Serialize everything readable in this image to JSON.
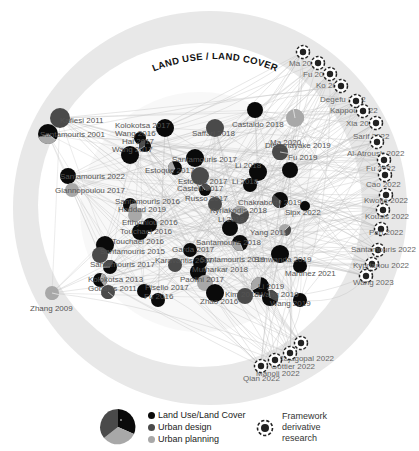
{
  "title": "LAND USE / LAND COVER",
  "colors": {
    "outer_ring": "#e6e6e6",
    "inner_disk": "#ffffff",
    "edge": "#bdbdbd",
    "land_use": "#0a0a0a",
    "urban_design": "#4a4a4a",
    "urban_planning": "#a8a8a8",
    "label": "#555555"
  },
  "nodes": [
    {
      "label": "Kafiesi 2011",
      "x": 60,
      "y": 118,
      "r": 10,
      "lx": 60,
      "ly": 123
    },
    {
      "label": "Santamouris 2001",
      "x": 48,
      "y": 134,
      "r": 10,
      "lx": 40,
      "ly": 137
    },
    {
      "label": "Kolokotsa 2017",
      "x": 165,
      "y": 128,
      "r": 9,
      "lx": 115,
      "ly": 128
    },
    {
      "label": "Wang 2016",
      "x": 140,
      "y": 138,
      "r": 6,
      "lx": 115,
      "ly": 136
    },
    {
      "label": "Hai 2017",
      "x": 145,
      "y": 146,
      "r": 6,
      "lx": 122,
      "ly": 144
    },
    {
      "label": "Saffari 2018",
      "x": 215,
      "y": 128,
      "r": 9,
      "lx": 192,
      "ly": 136
    },
    {
      "label": "Castaldo 2018",
      "x": 255,
      "y": 110,
      "r": 8,
      "lx": 232,
      "ly": 127
    },
    {
      "label": "Ma 2020",
      "x": 295,
      "y": 118,
      "r": 9,
      "lx": 270,
      "ly": 145
    },
    {
      "label": "Wang 2017",
      "x": 130,
      "y": 155,
      "r": 9,
      "lx": 112,
      "ly": 152
    },
    {
      "label": "Santamouris 2017",
      "x": 195,
      "y": 158,
      "r": 9,
      "lx": 172,
      "ly": 162
    },
    {
      "label": "Dissanayake 2019",
      "x": 280,
      "y": 152,
      "r": 8,
      "lx": 265,
      "ly": 148
    },
    {
      "label": "Fu 2019",
      "x": 290,
      "y": 170,
      "r": 8,
      "lx": 288,
      "ly": 160
    },
    {
      "label": "Santamouris 2022",
      "x": 68,
      "y": 176,
      "r": 8,
      "lx": 60,
      "ly": 179
    },
    {
      "label": "Estoque 2017",
      "x": 175,
      "y": 168,
      "r": 7,
      "lx": 145,
      "ly": 173
    },
    {
      "label": "Giannopoulou 2017",
      "x": 72,
      "y": 190,
      "r": 7,
      "lx": 55,
      "ly": 193
    },
    {
      "label": "Estoque 2017",
      "x": 200,
      "y": 176,
      "r": 9,
      "lx": 178,
      "ly": 184
    },
    {
      "label": "Castelli 2017",
      "x": 205,
      "y": 190,
      "r": 6,
      "lx": 177,
      "ly": 191
    },
    {
      "label": "Li 2018",
      "x": 258,
      "y": 172,
      "r": 9,
      "lx": 235,
      "ly": 168
    },
    {
      "label": "Li 2018",
      "x": 250,
      "y": 185,
      "r": 7,
      "lx": 232,
      "ly": 184
    },
    {
      "label": "Santamouris 2016",
      "x": 130,
      "y": 205,
      "r": 7,
      "lx": 115,
      "ly": 204
    },
    {
      "label": "Russo 2017",
      "x": 215,
      "y": 204,
      "r": 7,
      "lx": 185,
      "ly": 201
    },
    {
      "label": "Haddad 2019",
      "x": 135,
      "y": 215,
      "r": 7,
      "lx": 118,
      "ly": 212
    },
    {
      "label": "Chakraborty 2019",
      "x": 280,
      "y": 200,
      "r": 8,
      "lx": 238,
      "ly": 205
    },
    {
      "label": "Sipx 2022",
      "x": 305,
      "y": 206,
      "r": 5,
      "lx": 285,
      "ly": 215
    },
    {
      "label": "Efthymiou 2016",
      "x": 150,
      "y": 225,
      "r": 7,
      "lx": 122,
      "ly": 225
    },
    {
      "label": "Kyriakodis 2018",
      "x": 240,
      "y": 215,
      "r": 9,
      "lx": 210,
      "ly": 213
    },
    {
      "label": "Touchaei 2016",
      "x": 140,
      "y": 232,
      "r": 8,
      "lx": 120,
      "ly": 234
    },
    {
      "label": "Li 2018",
      "x": 230,
      "y": 228,
      "r": 8,
      "lx": 218,
      "ly": 222
    },
    {
      "label": "Yang 2019",
      "x": 285,
      "y": 230,
      "r": 6,
      "lx": 250,
      "ly": 235
    },
    {
      "label": "Touchaei 2016",
      "x": 105,
      "y": 245,
      "r": 9,
      "lx": 112,
      "ly": 244
    },
    {
      "label": "Santamouris 2015",
      "x": 100,
      "y": 255,
      "r": 8,
      "lx": 100,
      "ly": 254
    },
    {
      "label": "Santamouris 2018",
      "x": 240,
      "y": 243,
      "r": 8,
      "lx": 196,
      "ly": 245
    },
    {
      "label": "Garda 2017",
      "x": 190,
      "y": 250,
      "r": 7,
      "lx": 172,
      "ly": 252
    },
    {
      "label": "Simwanda 2019",
      "x": 280,
      "y": 254,
      "r": 9,
      "lx": 254,
      "ly": 262
    },
    {
      "label": "Santamouris 2017",
      "x": 110,
      "y": 267,
      "r": 7,
      "lx": 90,
      "ly": 267
    },
    {
      "label": "Karavantis 2017",
      "x": 175,
      "y": 265,
      "r": 7,
      "lx": 155,
      "ly": 263
    },
    {
      "label": "Santamouris 2019",
      "x": 200,
      "y": 262,
      "r": 7,
      "lx": 200,
      "ly": 262
    },
    {
      "label": "Kolokotsa 2013",
      "x": 100,
      "y": 280,
      "r": 7,
      "lx": 88,
      "ly": 282
    },
    {
      "label": "Mutharkar 2018",
      "x": 198,
      "y": 272,
      "r": 8,
      "lx": 192,
      "ly": 272
    },
    {
      "label": "Martinez 2021",
      "x": 300,
      "y": 266,
      "r": 7,
      "lx": 285,
      "ly": 276
    },
    {
      "label": "Gobakis 2011",
      "x": 108,
      "y": 292,
      "r": 7,
      "lx": 88,
      "ly": 291
    },
    {
      "label": "Pisello 2017",
      "x": 144,
      "y": 291,
      "r": 7,
      "lx": 145,
      "ly": 290
    },
    {
      "label": "Paolini 2017",
      "x": 205,
      "y": 283,
      "r": 8,
      "lx": 180,
      "ly": 282
    },
    {
      "label": "Li 2019",
      "x": 260,
      "y": 286,
      "r": 9,
      "lx": 258,
      "ly": 289
    },
    {
      "label": "Fu 2016",
      "x": 158,
      "y": 300,
      "r": 7,
      "lx": 144,
      "ly": 299
    },
    {
      "label": "Kim 2018",
      "x": 245,
      "y": 296,
      "r": 8,
      "lx": 225,
      "ly": 297
    },
    {
      "label": "Wang 2019",
      "x": 270,
      "y": 298,
      "r": 8,
      "lx": 258,
      "ly": 297
    },
    {
      "label": "Zhao 2016",
      "x": 215,
      "y": 293,
      "r": 9,
      "lx": 200,
      "ly": 304
    },
    {
      "label": "Wang 2019",
      "x": 300,
      "y": 300,
      "r": 7,
      "lx": 270,
      "ly": 306
    },
    {
      "label": "Zhang 2009",
      "x": 52,
      "y": 293,
      "r": 7,
      "lx": 30,
      "ly": 311
    }
  ],
  "framework_nodes": [
    {
      "label": "Ma 2022",
      "x": 303,
      "y": 52,
      "lx": 289,
      "ly": 66
    },
    {
      "label": "Fu 2022",
      "x": 318,
      "y": 63,
      "lx": 303,
      "ly": 77
    },
    {
      "label": "Ko 2022",
      "x": 330,
      "y": 74,
      "lx": 316,
      "ly": 88
    },
    {
      "label": "Degefu 2022",
      "x": 341,
      "y": 86,
      "lx": 320,
      "ly": 102
    },
    {
      "label": "Kappou 2022",
      "x": 356,
      "y": 101,
      "lx": 330,
      "ly": 113
    },
    {
      "label": "Xia 2022",
      "x": 363,
      "y": 111,
      "lx": 346,
      "ly": 126
    },
    {
      "label": "Sarif 2022",
      "x": 376,
      "y": 123,
      "lx": 353,
      "ly": 139
    },
    {
      "label": "Al-Atroush 2022",
      "x": 377,
      "y": 142,
      "lx": 347,
      "ly": 156
    },
    {
      "label": "Fu 2022",
      "x": 384,
      "y": 160,
      "lx": 366,
      "ly": 171
    },
    {
      "label": "Cao 2022",
      "x": 385,
      "y": 175,
      "lx": 366,
      "ly": 187
    },
    {
      "label": "Kwofie 2022",
      "x": 386,
      "y": 195,
      "lx": 364,
      "ly": 203
    },
    {
      "label": "Kousis 2022",
      "x": 383,
      "y": 210,
      "lx": 365,
      "ly": 219
    },
    {
      "label": "Pan 2022",
      "x": 381,
      "y": 229,
      "lx": 369,
      "ly": 235
    },
    {
      "label": "Santamouris 2022",
      "x": 378,
      "y": 250,
      "lx": 351,
      "ly": 252
    },
    {
      "label": "Kyprianou 2022",
      "x": 372,
      "y": 264,
      "lx": 353,
      "ly": 268
    },
    {
      "label": "Wang 2023",
      "x": 366,
      "y": 276,
      "lx": 353,
      "ly": 285
    },
    {
      "label": "Rajagopal 2022",
      "x": 301,
      "y": 343,
      "lx": 278,
      "ly": 361
    },
    {
      "label": "Gottier 2022",
      "x": 290,
      "y": 353,
      "lx": 271,
      "ly": 369
    },
    {
      "label": "Manoli 2022",
      "x": 275,
      "y": 360,
      "lx": 256,
      "ly": 376
    },
    {
      "label": "Qian 2022",
      "x": 261,
      "y": 366,
      "lx": 243,
      "ly": 381
    }
  ],
  "legend": {
    "categories": [
      {
        "label": "Land Use/Land Cover",
        "color": "#0a0a0a"
      },
      {
        "label": "Urban design",
        "color": "#4a4a4a"
      },
      {
        "label": "Urban planning",
        "color": "#a8a8a8"
      }
    ],
    "framework": {
      "line1": "Framework",
      "line2": "derivative",
      "line3": "research"
    }
  }
}
